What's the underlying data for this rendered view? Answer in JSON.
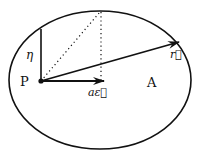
{
  "diagram": {
    "type": "ellipse-orbit",
    "labels": {
      "focus": "P",
      "apoapsis": "A",
      "eta": "η",
      "a_eps": "aε⃗",
      "r_vec": "r⃗"
    },
    "colors": {
      "stroke": "#111111",
      "background": "#ffffff"
    }
  }
}
